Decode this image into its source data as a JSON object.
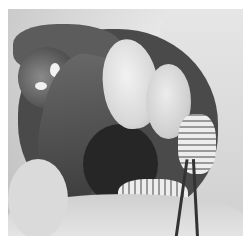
{
  "image": {
    "description": "Grayscale photograph of an open abdominal dissection showing kidney, liver lobe, stomach and intestinal loops, with forceps at lower right",
    "colors": {
      "background": "#ffffff",
      "tissue_dark": "#3a3a3a",
      "tissue_light": "#e6e6e6"
    }
  }
}
